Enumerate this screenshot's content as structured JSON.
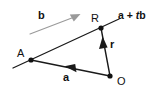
{
  "figure": {
    "type": "vector-geometry-diagram",
    "background_color": "#ffffff",
    "line_color": "#111111",
    "guide_color": "#9a9a9a",
    "width": 159,
    "height": 99
  },
  "points": [
    {
      "id": "A",
      "label": "A",
      "x": 31,
      "y": 60,
      "label_x": 17,
      "label_y": 48
    },
    {
      "id": "R",
      "label": "R",
      "x": 101,
      "y": 28,
      "label_x": 91,
      "label_y": 13
    },
    {
      "id": "O",
      "label": "O",
      "x": 110,
      "y": 76,
      "label_x": 117,
      "label_y": 76
    }
  ],
  "vectors": [
    {
      "id": "a",
      "label": "a",
      "from": "O",
      "to": "A",
      "x1": 110,
      "y1": 76,
      "x2": 31,
      "y2": 60,
      "arrow_at_x": 70,
      "arrow_at_y": 68,
      "label_x": 63,
      "label_y": 72,
      "bold": true
    },
    {
      "id": "r",
      "label": "r",
      "from": "O",
      "to": "R",
      "x1": 110,
      "y1": 76,
      "x2": 101,
      "y2": 28,
      "arrow_at_x": 104,
      "arrow_at_y": 44,
      "label_x": 110,
      "label_y": 39,
      "bold": true
    },
    {
      "id": "b",
      "label": "b",
      "description": "direction vector guide arrow",
      "x1": 30,
      "y1": 34,
      "x2": 79,
      "y2": 15,
      "label_x": 38,
      "label_y": 10,
      "bold": true,
      "color": "#9a9a9a"
    }
  ],
  "line": {
    "id": "line-AR",
    "description": "straight line through A and R, extended past both ends",
    "x1": 13,
    "y1": 68,
    "x2": 119,
    "y2": 19
  },
  "expression": {
    "id": "position-expression",
    "text": "a + tb",
    "parts": {
      "vector_a": "a",
      "operator": " + ",
      "scalar": "t",
      "vector_b": "b"
    },
    "label_x": 118,
    "label_y": 10
  }
}
